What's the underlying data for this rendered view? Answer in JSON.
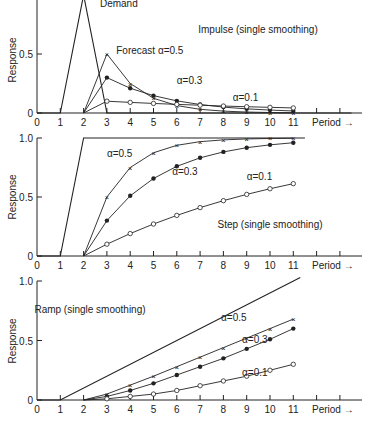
{
  "figure": {
    "xaxis_label": "Period →",
    "ylabel": "Response",
    "x_ticks": [
      0,
      1,
      2,
      3,
      4,
      5,
      6,
      7,
      8,
      9,
      10,
      11
    ],
    "colors": {
      "ink": "#222222",
      "background": "#ffffff"
    }
  },
  "chart_data": [
    {
      "type": "line",
      "title": "Impulse (single smoothing)",
      "xlabel": "Period →",
      "ylabel": "Response",
      "xlim": [
        0,
        13.5
      ],
      "ylim": [
        0,
        1.0
      ],
      "y_ticks": [
        0,
        0.5
      ],
      "y_tick_labels": [
        "0",
        "0.5"
      ],
      "demand": {
        "name": "Demand",
        "x": [
          0,
          1,
          2,
          3,
          13.5
        ],
        "y": [
          0,
          0,
          1.0,
          0,
          0
        ]
      },
      "series": [
        {
          "name": "Forecast α=0.5",
          "marker": "x",
          "x": [
            2,
            3,
            4,
            5,
            6,
            7,
            8,
            9,
            10,
            11
          ],
          "y": [
            0,
            0.5,
            0.25,
            0.125,
            0.063,
            0.031,
            0.016,
            0.008,
            0.004,
            0.002
          ]
        },
        {
          "name": "α=0.3",
          "marker": "filled-circle",
          "x": [
            2,
            3,
            4,
            5,
            6,
            7,
            8,
            9,
            10,
            11
          ],
          "y": [
            0,
            0.3,
            0.21,
            0.147,
            0.103,
            0.072,
            0.05,
            0.035,
            0.025,
            0.017
          ]
        },
        {
          "name": "α=0.1",
          "marker": "open-circle",
          "x": [
            2,
            3,
            4,
            5,
            6,
            7,
            8,
            9,
            10,
            11
          ],
          "y": [
            0,
            0.1,
            0.09,
            0.081,
            0.073,
            0.066,
            0.059,
            0.053,
            0.048,
            0.043
          ]
        }
      ],
      "annotations": [
        {
          "text": "Demand",
          "x": 2.7,
          "y": 0.9
        },
        {
          "text": "Forecast α=0.5",
          "x": 3.4,
          "y": 0.5
        },
        {
          "text": "α=0.3",
          "x": 6.0,
          "y": 0.25
        },
        {
          "text": "α=0.1",
          "x": 8.4,
          "y": 0.1
        }
      ]
    },
    {
      "type": "line",
      "title": "Step (single smoothing)",
      "xlabel": "Period →",
      "ylabel": "Response",
      "xlim": [
        0,
        13.5
      ],
      "ylim": [
        0,
        1.0
      ],
      "y_ticks": [
        0,
        0.5,
        1.0
      ],
      "y_tick_labels": [
        "0",
        "0.5",
        "1.0"
      ],
      "demand": {
        "name": "Demand",
        "x": [
          0,
          1,
          2,
          11.5
        ],
        "y": [
          0,
          0,
          1.0,
          1.0
        ]
      },
      "series": [
        {
          "name": "α=0.5",
          "marker": "x",
          "x": [
            2,
            3,
            4,
            5,
            6,
            7,
            8,
            9,
            10,
            11
          ],
          "y": [
            0,
            0.5,
            0.75,
            0.875,
            0.938,
            0.969,
            0.984,
            0.992,
            0.996,
            0.998
          ]
        },
        {
          "name": "α=0.3",
          "marker": "filled-circle",
          "x": [
            2,
            3,
            4,
            5,
            6,
            7,
            8,
            9,
            10,
            11
          ],
          "y": [
            0,
            0.3,
            0.51,
            0.657,
            0.76,
            0.832,
            0.882,
            0.918,
            0.942,
            0.96
          ]
        },
        {
          "name": "α=0.1",
          "marker": "open-circle",
          "x": [
            2,
            3,
            4,
            5,
            6,
            7,
            8,
            9,
            10,
            11
          ],
          "y": [
            0,
            0.1,
            0.19,
            0.271,
            0.344,
            0.41,
            0.469,
            0.522,
            0.57,
            0.613
          ]
        }
      ],
      "annotations": [
        {
          "text": "α=0.5",
          "x": 3.0,
          "y": 0.84
        },
        {
          "text": "α=0.3",
          "x": 5.8,
          "y": 0.69
        },
        {
          "text": "α=0.1",
          "x": 9.0,
          "y": 0.64
        }
      ]
    },
    {
      "type": "line",
      "title": "Ramp (single smoothing)",
      "xlabel": "Period →",
      "ylabel": "Response",
      "xlim": [
        0,
        13.5
      ],
      "ylim": [
        0,
        1.0
      ],
      "y_ticks": [
        0,
        0.5,
        1.0
      ],
      "y_tick_labels": [
        "0",
        "0.5",
        "1.0"
      ],
      "demand": {
        "name": "Demand",
        "x": [
          0,
          1,
          11.3
        ],
        "y": [
          0,
          0,
          1.03
        ]
      },
      "series": [
        {
          "name": "α=0.5",
          "marker": "x",
          "x": [
            2,
            3,
            4,
            5,
            6,
            7,
            8,
            9,
            10,
            11
          ],
          "y": [
            0,
            0.05,
            0.125,
            0.2,
            0.28,
            0.36,
            0.44,
            0.52,
            0.6,
            0.68
          ]
        },
        {
          "name": "α=0.3",
          "marker": "filled-circle",
          "x": [
            2,
            3,
            4,
            5,
            6,
            7,
            8,
            9,
            10,
            11
          ],
          "y": [
            0,
            0.03,
            0.08,
            0.14,
            0.21,
            0.28,
            0.35,
            0.43,
            0.51,
            0.6
          ]
        },
        {
          "name": "α=0.1",
          "marker": "open-circle",
          "x": [
            2,
            3,
            4,
            5,
            6,
            7,
            8,
            9,
            10,
            11
          ],
          "y": [
            0,
            0.01,
            0.03,
            0.05,
            0.08,
            0.12,
            0.16,
            0.2,
            0.25,
            0.3
          ]
        }
      ],
      "annotations": [
        {
          "text": "α=0.5",
          "x": 7.9,
          "y": 0.66
        },
        {
          "text": "α=0.3",
          "x": 8.8,
          "y": 0.48
        },
        {
          "text": "α=0.1",
          "x": 8.8,
          "y": 0.2
        }
      ]
    }
  ]
}
